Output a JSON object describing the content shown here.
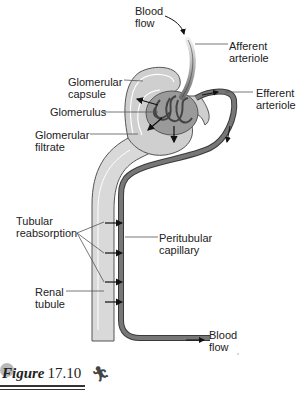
{
  "labels": {
    "blood_flow_in": "Blood\nflow",
    "afferent_arteriole": "Afferent\narteriole",
    "glomerular_capsule": "Glomerular\ncapsule",
    "efferent_arteriole": "Efferent\narteriole",
    "glomerulus": "Glomerulus",
    "glomerular_filtrate": "Glomerular\nfiltrate",
    "tubular_reabsorption": "Tubular\nreabsorption",
    "peritubular_capillary": "Peritubular\ncapillary",
    "renal_tubule": "Renal\ntubule",
    "blood_flow_out": "Blood\nflow"
  },
  "figure": {
    "word": "Figure",
    "number": "17.10"
  },
  "colors": {
    "vessel": "#6e6e6e",
    "vessel_outline": "#3a3a3a",
    "tubule_fill": "#d9d9d9",
    "capsule_fill": "#cfcfcf",
    "glomerulus_fill": "#8a8a8a",
    "leader_line": "#555555"
  }
}
